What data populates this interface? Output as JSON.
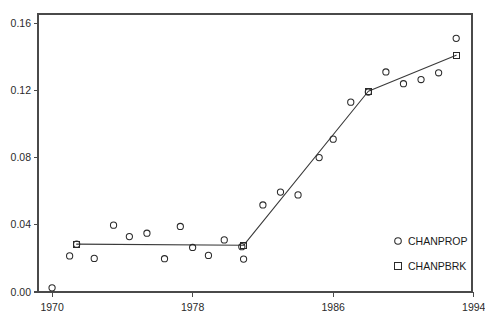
{
  "chart_data": {
    "type": "scatter",
    "title": "",
    "subtitle": "",
    "xlabel": "",
    "ylabel": "",
    "xlim": [
      1969.2,
      1993.9
    ],
    "ylim": [
      0.0,
      0.1655
    ],
    "grid": false,
    "legend_position": "bottom-right",
    "x_ticks": [
      1970,
      1978,
      1986,
      1994
    ],
    "x_tick_labels": [
      "1970",
      "1978",
      "1986",
      "1994"
    ],
    "y_ticks": [
      0.0,
      0.04,
      0.08,
      0.12,
      0.16
    ],
    "y_tick_labels": [
      "0.00",
      "0.04",
      "0.08",
      "0.12",
      "0.16"
    ],
    "series": [
      {
        "name": "CHANPROP",
        "marker": "circle",
        "style": "points",
        "x": [
          1970,
          1971,
          1971.4,
          1972.4,
          1973.5,
          1974.4,
          1975.4,
          1976.4,
          1977.3,
          1978,
          1978.9,
          1979.8,
          1980.8,
          1980.9,
          1982,
          1983,
          1984,
          1985.2,
          1986,
          1987,
          1988,
          1989,
          1990,
          1991,
          1992,
          1993
        ],
        "y": [
          0.0025,
          0.0215,
          0.0285,
          0.02,
          0.0398,
          0.033,
          0.035,
          0.0198,
          0.039,
          0.0265,
          0.0218,
          0.031,
          0.027,
          0.0196,
          0.0518,
          0.0595,
          0.0578,
          0.08,
          0.091,
          0.113,
          0.119,
          0.131,
          0.124,
          0.1265,
          0.1305,
          0.151
        ]
      },
      {
        "name": "CHANPBRK",
        "marker": "square",
        "style": "line-with-knots",
        "x": [
          1971.4,
          1980.9,
          1988,
          1993
        ],
        "y": [
          0.0285,
          0.0278,
          0.1195,
          0.141
        ]
      }
    ],
    "legend_entries": [
      {
        "label": "CHANPROP",
        "marker": "circle"
      },
      {
        "label": "CHANPBRK",
        "marker": "square"
      }
    ]
  },
  "layout": {
    "plot_left_px": 38,
    "plot_right_px": 472,
    "plot_top_px": 14,
    "plot_bottom_px": 292
  }
}
